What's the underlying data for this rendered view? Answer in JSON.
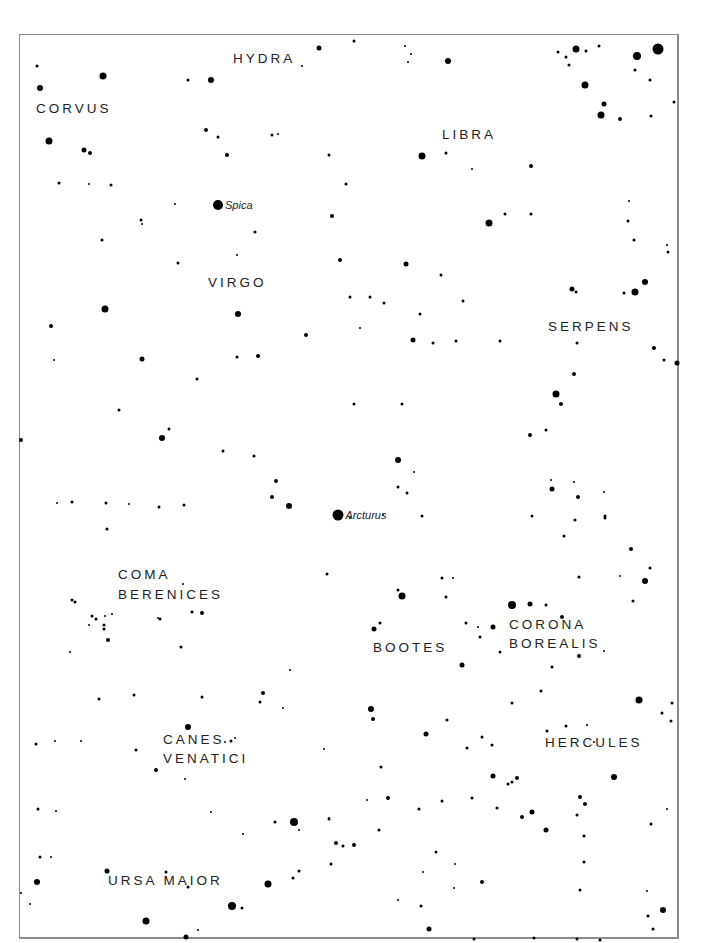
{
  "map": {
    "type": "star chart",
    "frame": {
      "left": 19,
      "top": 34,
      "right": 680,
      "bottom": 940,
      "border_color": "#8a8a8a"
    },
    "colors": {
      "background": "#ffffff",
      "stars": "#000000",
      "labels": "#222222"
    }
  },
  "constellations": [
    {
      "name": "HYDRA",
      "x": 233,
      "y": 58
    },
    {
      "name": "CORVUS",
      "x": 36,
      "y": 108
    },
    {
      "name": "LIBRA",
      "x": 442,
      "y": 134
    },
    {
      "name": "VIRGO",
      "x": 208,
      "y": 282
    },
    {
      "name": "SERPENS",
      "x": 548,
      "y": 326
    },
    {
      "name": "COMA",
      "x": 118,
      "y": 574
    },
    {
      "name": "BERENICES",
      "x": 118,
      "y": 594
    },
    {
      "name": "BOOTES",
      "x": 373,
      "y": 647
    },
    {
      "name": "CORONA",
      "x": 509,
      "y": 624
    },
    {
      "name": "BOREALIS",
      "x": 509,
      "y": 643
    },
    {
      "name": "HERCULES",
      "x": 545,
      "y": 742
    },
    {
      "name": "CANES",
      "x": 163,
      "y": 739
    },
    {
      "name": "VENATICI",
      "x": 163,
      "y": 758
    },
    {
      "name": "URSA MAIOR",
      "x": 108,
      "y": 880
    }
  ],
  "named_stars": [
    {
      "name": "Spica",
      "x": 218,
      "y": 205,
      "size": 10
    },
    {
      "name": "Arcturus",
      "x": 338,
      "y": 515,
      "size": 11
    }
  ],
  "stars": [
    [
      37,
      66,
      3
    ],
    [
      40,
      88,
      6
    ],
    [
      103,
      76,
      7
    ],
    [
      211,
      80,
      6
    ],
    [
      188,
      80,
      3
    ],
    [
      319,
      48,
      5
    ],
    [
      302,
      66,
      2
    ],
    [
      354,
      41,
      3
    ],
    [
      448,
      61,
      6
    ],
    [
      408,
      62,
      2
    ],
    [
      411,
      54,
      2
    ],
    [
      405,
      46,
      2
    ],
    [
      576,
      49,
      7
    ],
    [
      558,
      52,
      3
    ],
    [
      566,
      57,
      3
    ],
    [
      569,
      65,
      3
    ],
    [
      586,
      51,
      3
    ],
    [
      599,
      46,
      3
    ],
    [
      658,
      49,
      11
    ],
    [
      637,
      56,
      8
    ],
    [
      635,
      70,
      3
    ],
    [
      650,
      80,
      3
    ],
    [
      585,
      85,
      7
    ],
    [
      604,
      104,
      5
    ],
    [
      601,
      115,
      7
    ],
    [
      620,
      119,
      4
    ],
    [
      651,
      116,
      3
    ],
    [
      674,
      102,
      3
    ],
    [
      49,
      141,
      7
    ],
    [
      84,
      150,
      5
    ],
    [
      90,
      153,
      4
    ],
    [
      59,
      183,
      3
    ],
    [
      89,
      184,
      2
    ],
    [
      111,
      185,
      3
    ],
    [
      206,
      130,
      4
    ],
    [
      218,
      137,
      3
    ],
    [
      227,
      155,
      4
    ],
    [
      272,
      135,
      3
    ],
    [
      278,
      134,
      2
    ],
    [
      329,
      155,
      3
    ],
    [
      422,
      156,
      7
    ],
    [
      446,
      153,
      3
    ],
    [
      531,
      166,
      4
    ],
    [
      489,
      223,
      7
    ],
    [
      505,
      214,
      3
    ],
    [
      531,
      214,
      3
    ],
    [
      472,
      169,
      2
    ],
    [
      629,
      201,
      2
    ],
    [
      628,
      221,
      3
    ],
    [
      634,
      240,
      3
    ],
    [
      667,
      245,
      2
    ],
    [
      668,
      252,
      3
    ],
    [
      141,
      220,
      3
    ],
    [
      102,
      240,
      3
    ],
    [
      142,
      224,
      2
    ],
    [
      175,
      204,
      2
    ],
    [
      237,
      255,
      2
    ],
    [
      255,
      232,
      3
    ],
    [
      346,
      184,
      3
    ],
    [
      332,
      216,
      4
    ],
    [
      178,
      263,
      3
    ],
    [
      105,
      309,
      7
    ],
    [
      51,
      326,
      4
    ],
    [
      238,
      314,
      6
    ],
    [
      340,
      260,
      4
    ],
    [
      406,
      264,
      5
    ],
    [
      441,
      275,
      3
    ],
    [
      463,
      301,
      3
    ],
    [
      350,
      297,
      3
    ],
    [
      370,
      297,
      3
    ],
    [
      384,
      303,
      3
    ],
    [
      306,
      335,
      4
    ],
    [
      413,
      340,
      5
    ],
    [
      433,
      343,
      3
    ],
    [
      456,
      341,
      3
    ],
    [
      500,
      341,
      3
    ],
    [
      420,
      314,
      3
    ],
    [
      572,
      289,
      5
    ],
    [
      576,
      292,
      3
    ],
    [
      645,
      282,
      6
    ],
    [
      635,
      292,
      7
    ],
    [
      624,
      293,
      3
    ],
    [
      654,
      348,
      4
    ],
    [
      577,
      343,
      3
    ],
    [
      664,
      360,
      3
    ],
    [
      677,
      363,
      5
    ],
    [
      142,
      359,
      5
    ],
    [
      21,
      440,
      4
    ],
    [
      54,
      360,
      2
    ],
    [
      197,
      379,
      3
    ],
    [
      119,
      410,
      3
    ],
    [
      162,
      438,
      6
    ],
    [
      169,
      429,
      3
    ],
    [
      237,
      357,
      3
    ],
    [
      258,
      356,
      4
    ],
    [
      360,
      328,
      2
    ],
    [
      354,
      404,
      3
    ],
    [
      402,
      404,
      3
    ],
    [
      398,
      460,
      6
    ],
    [
      414,
      472,
      2
    ],
    [
      407,
      493,
      3
    ],
    [
      398,
      487,
      3
    ],
    [
      574,
      374,
      4
    ],
    [
      556,
      394,
      7
    ],
    [
      561,
      404,
      4
    ],
    [
      530,
      435,
      4
    ],
    [
      546,
      430,
      3
    ],
    [
      552,
      489,
      5
    ],
    [
      578,
      497,
      4
    ],
    [
      575,
      520,
      3
    ],
    [
      605,
      518,
      3
    ],
    [
      631,
      549,
      4
    ],
    [
      645,
      581,
      6
    ],
    [
      650,
      568,
      3
    ],
    [
      57,
      503,
      2
    ],
    [
      72,
      502,
      3
    ],
    [
      106,
      503,
      3
    ],
    [
      107,
      529,
      3
    ],
    [
      72,
      600,
      3
    ],
    [
      75,
      602,
      3
    ],
    [
      129,
      504,
      2
    ],
    [
      159,
      507,
      3
    ],
    [
      184,
      505,
      3
    ],
    [
      289,
      506,
      6
    ],
    [
      272,
      497,
      4
    ],
    [
      276,
      481,
      4
    ],
    [
      223,
      451,
      3
    ],
    [
      254,
      456,
      3
    ],
    [
      183,
      584,
      2
    ],
    [
      160,
      619,
      3
    ],
    [
      158,
      618,
      2
    ],
    [
      192,
      612,
      3
    ],
    [
      202,
      613,
      4
    ],
    [
      105,
      616,
      2
    ],
    [
      112,
      614,
      2
    ],
    [
      92,
      616,
      3
    ],
    [
      96,
      619,
      3
    ],
    [
      104,
      625,
      3
    ],
    [
      104,
      629,
      3
    ],
    [
      108,
      640,
      4
    ],
    [
      89,
      625,
      2
    ],
    [
      70,
      652,
      2
    ],
    [
      181,
      647,
      3
    ],
    [
      99,
      699,
      3
    ],
    [
      134,
      695,
      3
    ],
    [
      202,
      697,
      3
    ],
    [
      263,
      693,
      4
    ],
    [
      260,
      702,
      3
    ],
    [
      283,
      708,
      2
    ],
    [
      327,
      574,
      3
    ],
    [
      290,
      670,
      2
    ],
    [
      350,
      518,
      2
    ],
    [
      383,
      515,
      2
    ],
    [
      422,
      516,
      3
    ],
    [
      374,
      629,
      5
    ],
    [
      380,
      623,
      3
    ],
    [
      398,
      590,
      3
    ],
    [
      402,
      596,
      7
    ],
    [
      446,
      597,
      3
    ],
    [
      442,
      578,
      3
    ],
    [
      453,
      578,
      2
    ],
    [
      462,
      665,
      5
    ],
    [
      466,
      623,
      3
    ],
    [
      478,
      627,
      2
    ],
    [
      480,
      637,
      3
    ],
    [
      493,
      627,
      5
    ],
    [
      500,
      652,
      3
    ],
    [
      512,
      605,
      8
    ],
    [
      530,
      604,
      5
    ],
    [
      546,
      605,
      3
    ],
    [
      562,
      617,
      4
    ],
    [
      633,
      601,
      3
    ],
    [
      620,
      576,
      2
    ],
    [
      579,
      577,
      3
    ],
    [
      551,
      480,
      2
    ],
    [
      574,
      482,
      2
    ],
    [
      604,
      492,
      2
    ],
    [
      605,
      516,
      3
    ],
    [
      532,
      516,
      3
    ],
    [
      564,
      536,
      3
    ],
    [
      512,
      703,
      3
    ],
    [
      541,
      691,
      3
    ],
    [
      579,
      656,
      4
    ],
    [
      552,
      667,
      3
    ],
    [
      604,
      651,
      2
    ],
    [
      639,
      700,
      7
    ],
    [
      662,
      713,
      3
    ],
    [
      371,
      709,
      6
    ],
    [
      373,
      719,
      4
    ],
    [
      426,
      734,
      5
    ],
    [
      447,
      720,
      3
    ],
    [
      482,
      737,
      3
    ],
    [
      467,
      748,
      3
    ],
    [
      492,
      745,
      3
    ],
    [
      517,
      778,
      4
    ],
    [
      547,
      731,
      3
    ],
    [
      566,
      726,
      3
    ],
    [
      587,
      725,
      2
    ],
    [
      594,
      742,
      2
    ],
    [
      614,
      777,
      6
    ],
    [
      672,
      703,
      3
    ],
    [
      671,
      721,
      3
    ],
    [
      36,
      744,
      3
    ],
    [
      55,
      741,
      2
    ],
    [
      81,
      741,
      2
    ],
    [
      56,
      811,
      2
    ],
    [
      38,
      809,
      3
    ],
    [
      136,
      750,
      3
    ],
    [
      156,
      770,
      4
    ],
    [
      188,
      727,
      6
    ],
    [
      231,
      741,
      3
    ],
    [
      225,
      742,
      2
    ],
    [
      235,
      738,
      2
    ],
    [
      185,
      779,
      2
    ],
    [
      324,
      749,
      2
    ],
    [
      211,
      812,
      2
    ],
    [
      329,
      818,
      2
    ],
    [
      243,
      834,
      2
    ],
    [
      275,
      822,
      3
    ],
    [
      294,
      822,
      8
    ],
    [
      299,
      830,
      2
    ],
    [
      329,
      819,
      3
    ],
    [
      367,
      800,
      2
    ],
    [
      381,
      767,
      3
    ],
    [
      388,
      798,
      4
    ],
    [
      419,
      809,
      3
    ],
    [
      442,
      801,
      3
    ],
    [
      472,
      798,
      3
    ],
    [
      493,
      776,
      5
    ],
    [
      508,
      784,
      3
    ],
    [
      512,
      782,
      3
    ],
    [
      497,
      808,
      3
    ],
    [
      522,
      817,
      4
    ],
    [
      546,
      830,
      5
    ],
    [
      532,
      812,
      5
    ],
    [
      580,
      797,
      4
    ],
    [
      585,
      804,
      4
    ],
    [
      577,
      815,
      3
    ],
    [
      584,
      836,
      3
    ],
    [
      584,
      862,
      3
    ],
    [
      651,
      824,
      3
    ],
    [
      667,
      809,
      2
    ],
    [
      40,
      857,
      3
    ],
    [
      51,
      857,
      2
    ],
    [
      107,
      871,
      5
    ],
    [
      37,
      882,
      6
    ],
    [
      166,
      872,
      3
    ],
    [
      166,
      877,
      2
    ],
    [
      188,
      887,
      3
    ],
    [
      268,
      884,
      7
    ],
    [
      232,
      906,
      8
    ],
    [
      242,
      908,
      3
    ],
    [
      293,
      878,
      3
    ],
    [
      299,
      871,
      3
    ],
    [
      331,
      864,
      3
    ],
    [
      336,
      843,
      4
    ],
    [
      343,
      846,
      3
    ],
    [
      354,
      845,
      4
    ],
    [
      379,
      830,
      3
    ],
    [
      436,
      852,
      3
    ],
    [
      455,
      864,
      2
    ],
    [
      482,
      882,
      4
    ],
    [
      423,
      872,
      2
    ],
    [
      421,
      906,
      3
    ],
    [
      398,
      900,
      2
    ],
    [
      454,
      888,
      2
    ],
    [
      580,
      890,
      3
    ],
    [
      647,
      891,
      2
    ],
    [
      663,
      910,
      6
    ],
    [
      648,
      916,
      3
    ],
    [
      653,
      929,
      3
    ],
    [
      146,
      921,
      7
    ],
    [
      186,
      937,
      5
    ],
    [
      198,
      930,
      2
    ],
    [
      429,
      929,
      5
    ],
    [
      474,
      939,
      3
    ],
    [
      534,
      938,
      3
    ],
    [
      577,
      939,
      3
    ],
    [
      600,
      940,
      3
    ],
    [
      30,
      904,
      2
    ],
    [
      21,
      893,
      2
    ]
  ]
}
